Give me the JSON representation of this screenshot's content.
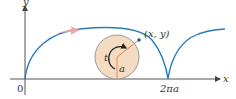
{
  "diagram": {
    "labels": {
      "y_axis": "y",
      "x_axis": "x",
      "origin": "0",
      "point": "(x, y)",
      "angle": "t",
      "radius": "a",
      "cusp": "2πa"
    },
    "colors": {
      "curve": "#2a7ab8",
      "circle_fill": "#f3dcc2",
      "circle_stroke": "#9a9a9a",
      "radius_line": "#e8874a",
      "direction_arrow": "#f2a3a3",
      "axis": "#555555"
    }
  }
}
